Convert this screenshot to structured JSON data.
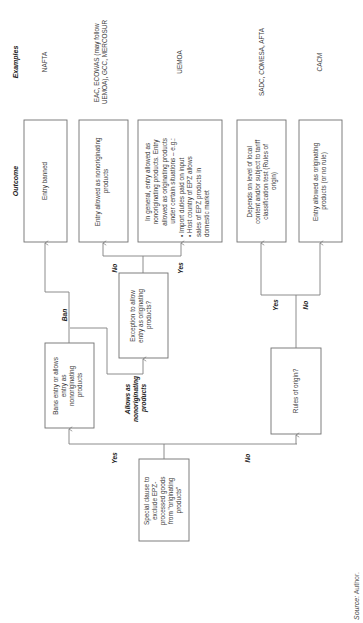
{
  "headers": {
    "outcome": "Outcome",
    "examples": "Examples"
  },
  "start_box": {
    "lines": [
      "Special clause to",
      "exclude EPZ-",
      "processed goods",
      "from \"originating",
      "products\""
    ]
  },
  "decision_bans": {
    "lines": [
      "Bans entry or allows",
      "entry as",
      "nonoriginating",
      "products"
    ]
  },
  "decision_exception": {
    "lines": [
      "Exception to allow",
      "entry as originating",
      "products?"
    ]
  },
  "decision_rules": {
    "lines": [
      "Rules of origin?"
    ]
  },
  "outcomes": [
    {
      "lines": [
        "Entry banned"
      ],
      "example": [
        "NAFTA"
      ]
    },
    {
      "lines": [
        "Entry allowed as nonoriginating",
        "products"
      ],
      "example": [
        "EAC, ECOWAS (may follow",
        "UEMOA), GCC, MERCOSUR"
      ]
    },
    {
      "lines": [
        "In general, entry allowed as",
        "nonoriginating products. Entry",
        "allowed as originating products",
        "under certain situations – e.g.:",
        "• Import duties paid on input",
        "• Host country of EPZ allows",
        "  sales of EPZ products in",
        "  domestic market"
      ],
      "example": [
        "UEMOA"
      ]
    },
    {
      "lines": [
        "Depends on level of local",
        "content and/or subject to tariff",
        "classification test (Rules of",
        "origin)"
      ],
      "example": [
        "SADC, COMESA, AFTA"
      ]
    },
    {
      "lines": [
        "Entry allowed as originating",
        "products (or no rule)"
      ],
      "example": [
        "CACM"
      ]
    }
  ],
  "edge_labels": {
    "yes_main": "Yes",
    "no_main": "No",
    "ban": "Ban",
    "allows": [
      "Allows as",
      "nonoriginating",
      "products"
    ],
    "no_exception": "No",
    "yes_exception": "Yes",
    "yes_rules": "Yes",
    "no_rules": "No"
  },
  "source": {
    "label": "Source:",
    "value": "Author."
  }
}
